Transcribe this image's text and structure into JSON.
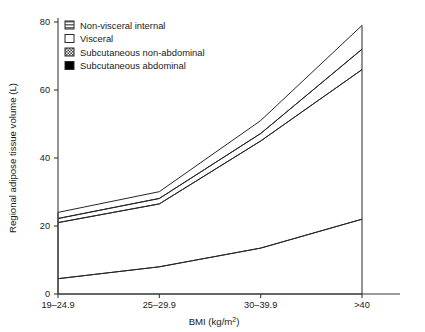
{
  "chart_data": {
    "type": "area",
    "title": "",
    "subtitle": "",
    "xlabel": "BMI (kg/m2)",
    "xlabel_display": "BMI (kg/m²)",
    "ylabel": "Regional adipose tissue volume (L)",
    "categories": [
      "19–24.9",
      "25–29.9",
      "30–39.9",
      ">40"
    ],
    "ylim": [
      0,
      80
    ],
    "xlim": [
      0,
      3
    ],
    "yticks": [
      0,
      20,
      40,
      60,
      80
    ],
    "ytick_labels": [
      "0",
      "20",
      "40",
      "60",
      "80"
    ],
    "grid": false,
    "stacked": true,
    "legend_position": "top-left",
    "series": [
      {
        "name": "Subcutaneous abdominal",
        "pattern": "solid-black",
        "color": "#000000",
        "values": [
          4.5,
          8.0,
          13.5,
          22.0
        ]
      },
      {
        "name": "Subcutaneous non-abdominal",
        "pattern": "dense-diagonal-hatch",
        "color": "#6e6e6e",
        "values": [
          16.5,
          18.5,
          31.5,
          44.0
        ]
      },
      {
        "name": "Visceral",
        "pattern": "white-empty",
        "color": "#ffffff",
        "values": [
          1.2,
          1.6,
          2.2,
          6.0
        ]
      },
      {
        "name": "Non-visceral internal",
        "pattern": "diagonal-hatch",
        "color": "#8a8a8a",
        "values": [
          1.8,
          2.0,
          3.8,
          7.0
        ]
      }
    ],
    "cumulative_tops": {
      "subcutaneous_abdominal": [
        4.5,
        8.0,
        13.5,
        22.0
      ],
      "subcutaneous_non_abdominal": [
        21.0,
        26.5,
        45.0,
        66.0
      ],
      "visceral": [
        22.2,
        28.1,
        47.2,
        72.0
      ],
      "non_visceral_internal": [
        24.0,
        30.1,
        51.0,
        79.0
      ]
    }
  },
  "legend": {
    "items": [
      {
        "label": "Non-visceral internal",
        "swatch": "hatch-horizontal-swatch"
      },
      {
        "label": "Visceral",
        "swatch": "white-swatch"
      },
      {
        "label": "Subcutaneous non-abdominal",
        "swatch": "checker-swatch"
      },
      {
        "label": "Subcutaneous abdominal",
        "swatch": "black-swatch"
      }
    ]
  },
  "axes": {
    "y_title": "Regional adipose tissue volume (L)",
    "x_title_main": "BMI (kg/m",
    "x_title_sup": "2",
    "x_title_tail": ")",
    "y_tick_0": "0",
    "y_tick_1": "20",
    "y_tick_2": "40",
    "y_tick_3": "60",
    "y_tick_4": "80",
    "x_tick_0": "19–24.9",
    "x_tick_1": "25–29.9",
    "x_tick_2": "30–39.9",
    "x_tick_3": ">40"
  }
}
